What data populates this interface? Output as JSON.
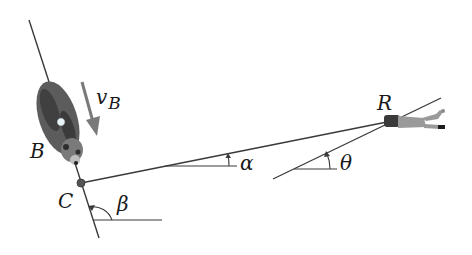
{
  "figure": {
    "labels": {
      "bear": "B",
      "velocity_main": "v",
      "velocity_sub": "B",
      "point_c": "C",
      "rider": "R",
      "alpha": "α",
      "beta": "β",
      "theta": "θ"
    },
    "colors": {
      "line": "#3a3a3a",
      "arrow": "#7a7a7a",
      "bear_body": "#5c5c5c",
      "bear_dark": "#2e2e2e",
      "rider": "#9a9a9a",
      "dot_c": "#555555",
      "dot_bear": "#e8f4f8"
    }
  }
}
